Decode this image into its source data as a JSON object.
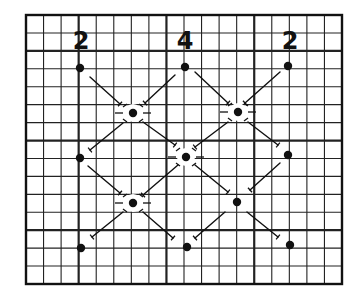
{
  "diagram": {
    "colors": {
      "ink": "#111111",
      "paper": "#ffffff",
      "grid": "#222222"
    },
    "grid": {
      "left": 26,
      "top": 15,
      "right": 342,
      "bottom": 284,
      "cols": 18,
      "rows": 15,
      "major_cols": [
        3,
        8,
        13
      ],
      "major_rows": [
        2,
        7,
        12
      ]
    },
    "labels": [
      {
        "text": "2",
        "x": 81,
        "y": 29
      },
      {
        "text": "4",
        "x": 185,
        "y": 29
      },
      {
        "text": "2",
        "x": 290,
        "y": 29
      }
    ],
    "dots": [
      {
        "x": 80,
        "y": 68,
        "halo": false
      },
      {
        "x": 185,
        "y": 67,
        "halo": false
      },
      {
        "x": 288,
        "y": 66,
        "halo": false
      },
      {
        "x": 133,
        "y": 113,
        "halo": true
      },
      {
        "x": 238,
        "y": 112,
        "halo": true
      },
      {
        "x": 80,
        "y": 158,
        "halo": false
      },
      {
        "x": 186,
        "y": 157,
        "halo": true
      },
      {
        "x": 288,
        "y": 155,
        "halo": false
      },
      {
        "x": 133,
        "y": 203,
        "halo": true
      },
      {
        "x": 237,
        "y": 202,
        "halo": false
      },
      {
        "x": 81,
        "y": 248,
        "halo": false
      },
      {
        "x": 187,
        "y": 247,
        "halo": false
      },
      {
        "x": 290,
        "y": 245,
        "halo": false
      }
    ],
    "segments": [
      [
        90,
        77,
        120,
        104
      ],
      [
        175,
        75,
        145,
        103
      ],
      [
        195,
        72,
        228,
        103
      ],
      [
        280,
        72,
        245,
        103
      ],
      [
        123,
        123,
        90,
        150
      ],
      [
        143,
        122,
        175,
        145
      ],
      [
        228,
        122,
        195,
        147
      ],
      [
        248,
        122,
        278,
        145
      ],
      [
        88,
        166,
        120,
        193
      ],
      [
        178,
        165,
        143,
        195
      ],
      [
        195,
        165,
        228,
        192
      ],
      [
        280,
        163,
        250,
        190
      ],
      [
        123,
        212,
        92,
        237
      ],
      [
        143,
        212,
        173,
        238
      ],
      [
        225,
        212,
        195,
        238
      ],
      [
        247,
        212,
        278,
        237
      ]
    ]
  }
}
